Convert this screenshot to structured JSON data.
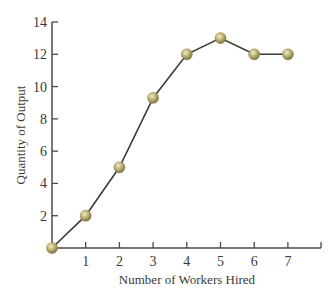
{
  "chart_data": {
    "type": "line",
    "title": "",
    "xlabel": "Number of Workers Hired",
    "ylabel": "Quantity of Output",
    "x": [
      0,
      1,
      2,
      3,
      4,
      5,
      6,
      7
    ],
    "series": [
      {
        "name": "Quantity of Output",
        "values": [
          0,
          2,
          5,
          9.3,
          12,
          13,
          12,
          12
        ]
      }
    ],
    "xticks": [
      "1",
      "2",
      "3",
      "4",
      "5",
      "6",
      "7"
    ],
    "yticks": [
      "2",
      "4",
      "6",
      "8",
      "10",
      "12",
      "14"
    ],
    "xlim": [
      0,
      8
    ],
    "ylim": [
      0,
      14
    ],
    "grid": false,
    "legend": "none",
    "colors": {
      "line": "#3b3b33",
      "marker": "#b8ad72",
      "axis": "#4a4a44"
    }
  }
}
